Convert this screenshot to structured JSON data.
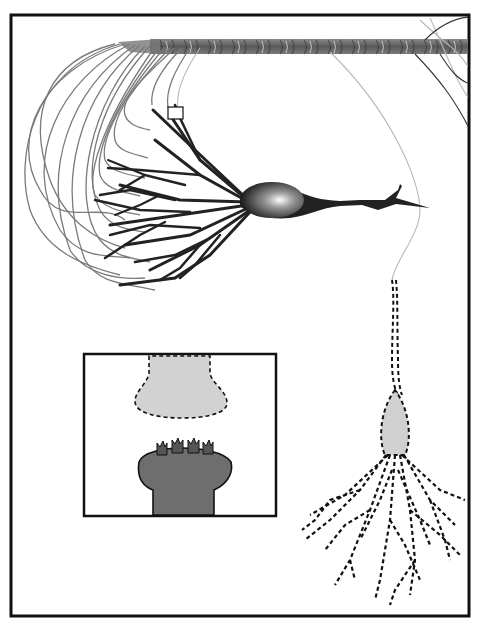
{
  "figure": {
    "width": 478,
    "height": 624,
    "background": "#ffffff",
    "frame": {
      "x": 11,
      "y": 15,
      "width": 458,
      "height": 601,
      "stroke": "#111111",
      "stroke_width": 3
    }
  },
  "colors": {
    "frame": "#111111",
    "axon_bundle": "#6a6a6a",
    "afferent_fibers": "#7a7a7a",
    "afferent_fibers_light": "#b8b8b8",
    "presynaptic_neuron": "#222222",
    "soma_highlight": "#ffffff",
    "postsynaptic_fill": "#d0d0d0",
    "postsynaptic_outline": "#111111",
    "inset_presynaptic_fill": "#d2d2d2",
    "inset_postsynaptic_fill": "#6e6e6e",
    "receptor_fill": "#555555"
  },
  "elements": {
    "axon_bundle": {
      "label": "axon bundle",
      "y_top": 39,
      "y_bottom": 54,
      "x_start": 120,
      "x_end": 469
    },
    "presynaptic_neuron": {
      "label": "neuron with branching dendrites",
      "soma_cx": 270,
      "soma_cy": 200
    },
    "highlight_box": {
      "label": "zoom region marker",
      "x": 168,
      "y": 107,
      "width": 15,
      "height": 12
    },
    "postsynaptic_neuron": {
      "label": "dashed-outline neuron",
      "soma_cx": 393,
      "soma_cy": 425
    },
    "inset": {
      "label": "synapse close-up",
      "x": 84,
      "y": 354,
      "width": 192,
      "height": 162,
      "presynaptic_terminal": "dashed light terminal",
      "postsynaptic_spine": "dark spine head",
      "receptor_count": 4
    }
  }
}
